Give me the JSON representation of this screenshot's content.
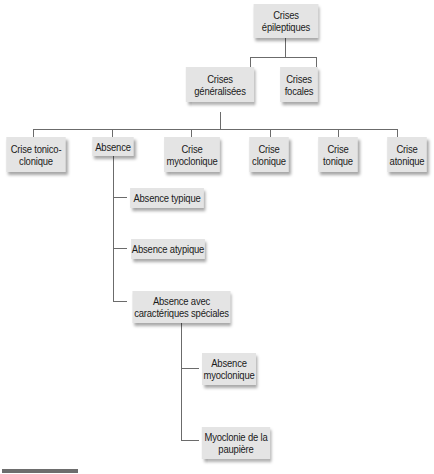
{
  "diagram": {
    "root": {
      "label": "Crises\népileptiques"
    },
    "level1": [
      {
        "label": "Crises\ngénéralisées"
      },
      {
        "label": "Crises\nfocales"
      }
    ],
    "level2": [
      {
        "label": "Crise tonico-\nclonique"
      },
      {
        "label": "Absence"
      },
      {
        "label": "Crise\nmyoclonique"
      },
      {
        "label": "Crise\nclonique"
      },
      {
        "label": "Crise\ntonique"
      },
      {
        "label": "Crise\natonique"
      }
    ],
    "absence_children": [
      {
        "label": "Absence typique"
      },
      {
        "label": "Absence atypique"
      },
      {
        "label": "Absence avec\ncaractériques spéciales"
      }
    ],
    "special_children": [
      {
        "label": "Absence\nmyoclonique"
      },
      {
        "label": "Myoclonie de la\npaupière"
      }
    ]
  },
  "colors": {
    "node_fill": "#e4e4e4",
    "connector": "#6b6b6b",
    "background": "#ffffff"
  }
}
